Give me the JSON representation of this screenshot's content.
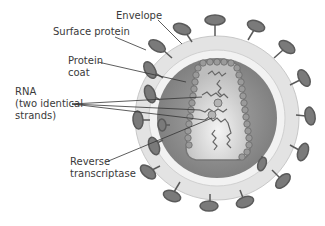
{
  "diagram": {
    "labels": [
      {
        "id": "envelope",
        "text": "Envelope"
      },
      {
        "id": "surface-protein",
        "text": "Surface protein"
      },
      {
        "id": "protein-coat",
        "text": "Protein\ncoat"
      },
      {
        "id": "rna",
        "text": "RNA\n(two identical\nstrands)"
      },
      {
        "id": "reverse-transcriptase",
        "text": "Reverse\ntranscriptase"
      }
    ]
  }
}
